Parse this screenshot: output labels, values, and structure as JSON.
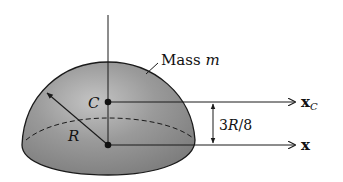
{
  "diagram": {
    "type": "hemisphere-center-of-mass",
    "labels": {
      "mass": "Mass ",
      "mass_var": "m",
      "center": "C",
      "radius": "R",
      "offset": "3R/8",
      "axis_c": "x",
      "axis_c_sub": "C",
      "axis_base": "x"
    },
    "colors": {
      "solid_fill": "#8f8f8f",
      "highlight": "#bdbdbd",
      "outline": "#1a1a1a",
      "background": "#ffffff"
    }
  }
}
